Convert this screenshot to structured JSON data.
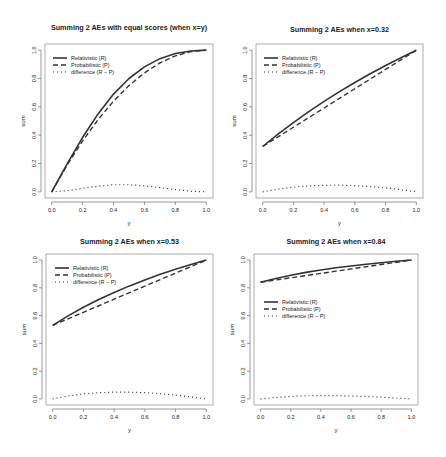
{
  "chart_data": [
    {
      "type": "line",
      "title": "Summing 2 AEs with equal scores (when x=y)",
      "xlabel": "y",
      "ylabel": "sum",
      "xlim": [
        0,
        1
      ],
      "ylim": [
        0,
        1
      ],
      "x_ticks": [
        "0.0",
        "0.2",
        "0.4",
        "0.6",
        "0.8",
        "1.0"
      ],
      "y_ticks": [
        "0.0",
        "0.2",
        "0.4",
        "0.6",
        "0.8",
        "1.0"
      ],
      "grid": false,
      "legend_position": "top-left",
      "x": [
        0,
        0.1,
        0.2,
        0.3,
        0.4,
        0.5,
        0.6,
        0.7,
        0.8,
        0.9,
        1.0
      ],
      "series": [
        {
          "name": "Relativistic (R)",
          "style": "solid",
          "values": [
            0,
            0.198,
            0.385,
            0.55,
            0.69,
            0.8,
            0.882,
            0.94,
            0.976,
            0.994,
            1.0
          ]
        },
        {
          "name": "Probabilistic (P)",
          "style": "dashed",
          "values": [
            0,
            0.19,
            0.36,
            0.51,
            0.64,
            0.75,
            0.84,
            0.91,
            0.96,
            0.99,
            1.0
          ]
        },
        {
          "name": "difference (R − P)",
          "style": "dotted",
          "values": [
            0,
            0.008,
            0.025,
            0.04,
            0.05,
            0.05,
            0.042,
            0.03,
            0.016,
            0.004,
            0
          ]
        }
      ]
    },
    {
      "type": "line",
      "title": "Summing 2 AEs when x=0.32",
      "xlabel": "y",
      "ylabel": "sum",
      "xlim": [
        0,
        1
      ],
      "ylim": [
        0,
        1
      ],
      "x_ticks": [
        "0.0",
        "0.2",
        "0.4",
        "0.6",
        "0.8",
        "1.0"
      ],
      "y_ticks": [
        "0.0",
        "0.2",
        "0.4",
        "0.6",
        "0.8",
        "1.0"
      ],
      "grid": false,
      "legend_position": "top-left",
      "x": [
        0,
        0.1,
        0.2,
        0.3,
        0.4,
        0.5,
        0.6,
        0.7,
        0.8,
        0.9,
        1.0
      ],
      "series": [
        {
          "name": "Relativistic (R)",
          "style": "solid",
          "values": [
            0.32,
            0.407,
            0.489,
            0.566,
            0.638,
            0.707,
            0.772,
            0.833,
            0.892,
            0.947,
            1.0
          ]
        },
        {
          "name": "Probabilistic (P)",
          "style": "dashed",
          "values": [
            0.32,
            0.388,
            0.456,
            0.524,
            0.592,
            0.66,
            0.728,
            0.796,
            0.864,
            0.932,
            1.0
          ]
        },
        {
          "name": "difference (R − P)",
          "style": "dotted",
          "values": [
            0,
            0.019,
            0.033,
            0.042,
            0.046,
            0.047,
            0.044,
            0.037,
            0.028,
            0.015,
            0
          ]
        }
      ]
    },
    {
      "type": "line",
      "title": "Summing 2 AEs when x=0.53",
      "xlabel": "y",
      "ylabel": "sum",
      "xlim": [
        0,
        1
      ],
      "ylim": [
        0,
        1
      ],
      "x_ticks": [
        "0.0",
        "0.2",
        "0.4",
        "0.6",
        "0.8",
        "1.0"
      ],
      "y_ticks": [
        "0.0",
        "0.2",
        "0.4",
        "0.6",
        "0.8",
        "1.0"
      ],
      "grid": false,
      "legend_position": "top-left",
      "x": [
        0,
        0.1,
        0.2,
        0.3,
        0.4,
        0.5,
        0.6,
        0.7,
        0.8,
        0.9,
        1.0
      ],
      "series": [
        {
          "name": "Relativistic (R)",
          "style": "solid",
          "values": [
            0.53,
            0.598,
            0.66,
            0.716,
            0.767,
            0.814,
            0.857,
            0.897,
            0.934,
            0.968,
            1.0
          ]
        },
        {
          "name": "Probabilistic (P)",
          "style": "dashed",
          "values": [
            0.53,
            0.577,
            0.624,
            0.671,
            0.718,
            0.765,
            0.812,
            0.859,
            0.906,
            0.953,
            1.0
          ]
        },
        {
          "name": "difference (R − P)",
          "style": "dotted",
          "values": [
            0,
            0.021,
            0.036,
            0.045,
            0.049,
            0.049,
            0.045,
            0.038,
            0.028,
            0.015,
            0
          ]
        }
      ]
    },
    {
      "type": "line",
      "title": "Summing 2 AEs when x=0.84",
      "xlabel": "y",
      "ylabel": "sum",
      "xlim": [
        0,
        1
      ],
      "ylim": [
        0,
        1
      ],
      "x_ticks": [
        "0.0",
        "0.2",
        "0.4",
        "0.6",
        "0.8",
        "1.0"
      ],
      "y_ticks": [
        "0.0",
        "0.2",
        "0.4",
        "0.6",
        "0.8",
        "1.0"
      ],
      "grid": false,
      "legend_position": "middle-left",
      "x": [
        0,
        0.1,
        0.2,
        0.3,
        0.4,
        0.5,
        0.6,
        0.7,
        0.8,
        0.9,
        1.0
      ],
      "series": [
        {
          "name": "Relativistic (R)",
          "style": "solid",
          "values": [
            0.84,
            0.867,
            0.89,
            0.911,
            0.928,
            0.944,
            0.957,
            0.97,
            0.981,
            0.991,
            1.0
          ]
        },
        {
          "name": "Probabilistic (P)",
          "style": "dashed",
          "values": [
            0.84,
            0.856,
            0.872,
            0.888,
            0.904,
            0.92,
            0.936,
            0.952,
            0.968,
            0.984,
            1.0
          ]
        },
        {
          "name": "difference (R − P)",
          "style": "dotted",
          "values": [
            0,
            0.011,
            0.018,
            0.023,
            0.024,
            0.024,
            0.021,
            0.018,
            0.013,
            0.007,
            0
          ]
        }
      ]
    }
  ],
  "layout": {
    "panels": [
      {
        "box": [
          45,
          44,
          213,
          198
        ],
        "title_y": 30,
        "legend": [
          53,
          58
        ]
      },
      {
        "box": [
          256,
          44,
          423,
          198
        ],
        "title_y": 32,
        "legend": [
          264,
          58
        ]
      },
      {
        "box": [
          46,
          254,
          213,
          405
        ],
        "title_y": 244,
        "legend": [
          55,
          268
        ]
      },
      {
        "box": [
          254,
          254,
          418,
          405
        ],
        "title_y": 244,
        "legend": [
          264,
          302
        ]
      }
    ],
    "colors": {
      "line": "#333333",
      "axis": "#555555",
      "box": "#999999"
    }
  }
}
